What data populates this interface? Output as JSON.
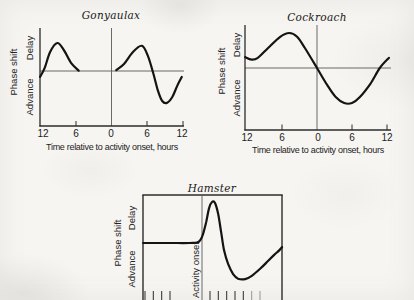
{
  "figure": {
    "kind": "scanned-book-figure",
    "background": "#f6f5f2",
    "ink_color": "#141414",
    "thin_line_color": "#5a5a5a"
  },
  "panels": [
    {
      "id": "gonyaulax",
      "title": "Gonyaulax",
      "ylabel": "Phase shift",
      "y_upper": "Delay",
      "y_lower": "Advance",
      "xlabel": "Time relative to activity onset, hours",
      "xticks": [
        "12",
        "6",
        "0",
        "6",
        "12"
      ]
    },
    {
      "id": "cockroach",
      "title": "Cockroach",
      "ylabel": "Phase shift",
      "y_upper": "Delay",
      "y_lower": "Advance",
      "xlabel": "Time relative to activity onset, hours",
      "xticks": [
        "12",
        "6",
        "0",
        "6",
        "12"
      ]
    },
    {
      "id": "hamster",
      "title": "Hamster",
      "ylabel": "Phase shift",
      "y_upper": "Delay",
      "y_lower": "Advance",
      "onset_label": "Activity onset"
    }
  ],
  "chart_data": [
    {
      "id": "gonyaulax",
      "type": "line",
      "title": "Gonyaulax",
      "xlabel": "Time relative to activity onset, hours",
      "ylabel": "Phase shift",
      "y_annotations": {
        "positive": "Delay",
        "negative": "Advance"
      },
      "xlim": [
        -12,
        12
      ],
      "xticks": [
        -12,
        -6,
        0,
        6,
        12
      ],
      "xtick_labels": [
        "12",
        "6",
        "0",
        "6",
        "12"
      ],
      "zero_line": true,
      "grid": false,
      "series": [
        {
          "name": "phase shift (arbitrary units, delay positive)",
          "segments": [
            [
              [
                -12,
                -0.21
              ],
              [
                -11.2,
                0.11
              ],
              [
                -10.3,
                0.68
              ],
              [
                -9.1,
                1.0
              ],
              [
                -8,
                0.75
              ],
              [
                -6.8,
                0.29
              ],
              [
                -5.5,
                0.01
              ]
            ],
            [
              [
                0.8,
                0.03
              ],
              [
                2.1,
                0.25
              ],
              [
                3.6,
                0.68
              ],
              [
                5.1,
                0.9
              ],
              [
                6.1,
                0.54
              ],
              [
                7,
                -0.07
              ],
              [
                7.8,
                -0.71
              ],
              [
                8.5,
                -1.07
              ],
              [
                9.3,
                -1.14
              ],
              [
                10.2,
                -0.93
              ],
              [
                11,
                -0.54
              ],
              [
                11.8,
                -0.21
              ]
            ]
          ]
        }
      ]
    },
    {
      "id": "cockroach",
      "type": "line",
      "title": "Cockroach",
      "xlabel": "Time relative to activity onset, hours",
      "ylabel": "Phase shift",
      "y_annotations": {
        "positive": "Delay",
        "negative": "Advance"
      },
      "xlim": [
        -12,
        12
      ],
      "xticks": [
        -12,
        -6,
        0,
        6,
        12
      ],
      "xtick_labels": [
        "12",
        "6",
        "0",
        "6",
        "12"
      ],
      "zero_line": true,
      "grid": false,
      "series": [
        {
          "name": "phase shift (arbitrary units, delay positive)",
          "segments": [
            [
              [
                -11.9,
                0.31
              ],
              [
                -10.8,
                0.24
              ],
              [
                -9.8,
                0.29
              ],
              [
                -8.1,
                0.57
              ],
              [
                -6.1,
                0.89
              ],
              [
                -4.6,
                1.0
              ],
              [
                -3.3,
                0.89
              ],
              [
                -2,
                0.57
              ],
              [
                0,
                0
              ],
              [
                1.7,
                -0.49
              ],
              [
                3.1,
                -0.83
              ],
              [
                4.5,
                -1.0
              ],
              [
                5.8,
                -1.0
              ],
              [
                7.1,
                -0.83
              ],
              [
                8.8,
                -0.46
              ],
              [
                10.4,
                0
              ],
              [
                11.9,
                0.29
              ]
            ]
          ]
        }
      ]
    },
    {
      "id": "hamster",
      "type": "line",
      "title": "Hamster",
      "xlabel": "",
      "ylabel": "Phase shift",
      "y_annotations": {
        "positive": "Delay",
        "negative": "Advance"
      },
      "x_marker_label": "Activity onset",
      "xlim": [
        -7.1,
        9.7
      ],
      "zero_line": false,
      "grid": false,
      "series": [
        {
          "name": "phase shift (arbitrary units, delay positive)",
          "segments": [
            [
              [
                -7.1,
                0
              ],
              [
                -4,
                0
              ],
              [
                -1.5,
                0
              ],
              [
                -0.6,
                0.01
              ],
              [
                -0.2,
                0.07
              ],
              [
                0.1,
                0.2
              ],
              [
                0.5,
                0.51
              ],
              [
                0.85,
                0.85
              ],
              [
                1.2,
                1.0
              ],
              [
                1.55,
                0.98
              ],
              [
                1.95,
                0.71
              ],
              [
                2.3,
                0.27
              ],
              [
                2.65,
                -0.17
              ],
              [
                3.15,
                -0.51
              ],
              [
                3.75,
                -0.76
              ],
              [
                4.35,
                -0.87
              ],
              [
                5.2,
                -0.88
              ],
              [
                6,
                -0.8
              ],
              [
                7,
                -0.63
              ],
              [
                7.95,
                -0.44
              ],
              [
                8.7,
                -0.29
              ],
              [
                9.3,
                -0.18
              ],
              [
                9.65,
                -0.1
              ]
            ]
          ]
        }
      ]
    }
  ]
}
